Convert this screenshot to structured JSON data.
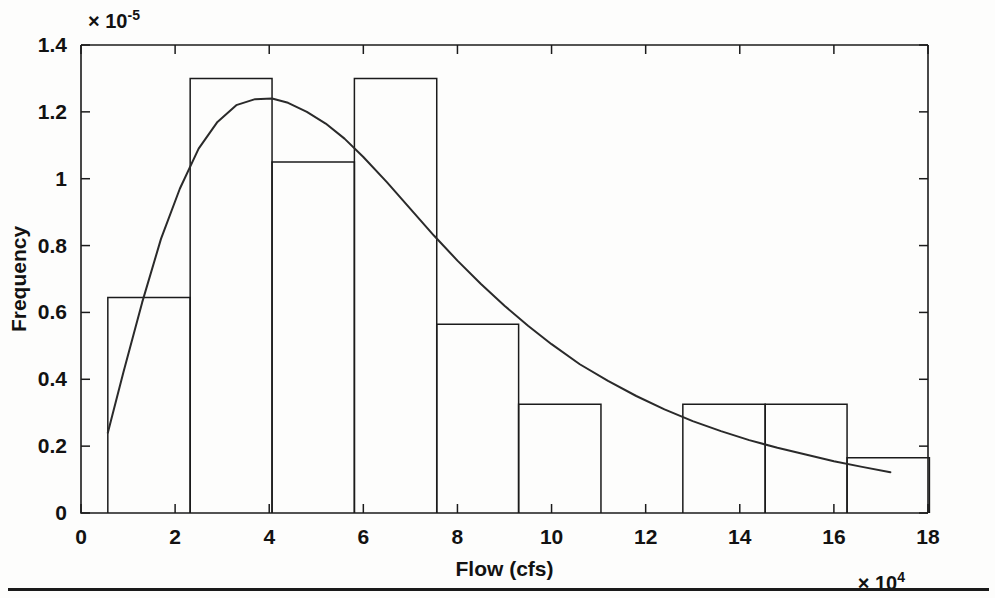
{
  "figure": {
    "background_color": "#fdfdfc",
    "ink_color": "#1b1b1b",
    "footer_rule": true
  },
  "chart_data": {
    "type": "bar",
    "title": "",
    "subtitle": "",
    "xlabel": "Flow (cfs)",
    "ylabel": "Frequency",
    "x_exponent_label": "× 10",
    "x_exponent_power": "4",
    "y_exponent_label": "× 10",
    "y_exponent_power": "-5",
    "x_multiplier": 10000,
    "y_multiplier": 1e-05,
    "xlim": [
      0,
      18
    ],
    "ylim": [
      0,
      1.4
    ],
    "xticks": [
      0,
      2,
      4,
      6,
      8,
      10,
      12,
      14,
      16,
      18
    ],
    "xticklabels": [
      "0",
      "2",
      "4",
      "6",
      "8",
      "10",
      "12",
      "14",
      "16",
      "18"
    ],
    "yticks": [
      0,
      0.2,
      0.4,
      0.6,
      0.8,
      1,
      1.2,
      1.4
    ],
    "yticklabels": [
      "0",
      "0.2",
      "0.4",
      "0.6",
      "0.8",
      "1",
      "1.2",
      "1.4"
    ],
    "grid": false,
    "legend": false,
    "legend_position": "none",
    "bin_edges": [
      0.57,
      2.32,
      4.06,
      5.81,
      7.56,
      9.3,
      11.05,
      12.79,
      14.54,
      16.28,
      18.03
    ],
    "bar_edges": [
      [
        0.57,
        2.32
      ],
      [
        2.32,
        4.06
      ],
      [
        4.06,
        5.81
      ],
      [
        5.81,
        7.56
      ],
      [
        7.56,
        9.3
      ],
      [
        9.3,
        11.05
      ],
      [
        12.79,
        14.54
      ],
      [
        14.54,
        16.28
      ],
      [
        16.28,
        18.03
      ]
    ],
    "values": [
      0.645,
      1.3,
      1.05,
      1.3,
      0.565,
      0.325,
      0.325,
      0.325,
      0.165
    ],
    "series": [
      {
        "name": "histogram",
        "values": [
          0.645,
          1.3,
          1.05,
          1.3,
          0.565,
          0.325,
          0.325,
          0.325,
          0.165
        ]
      },
      {
        "name": "fitted density curve",
        "x": [
          0.57,
          0.9,
          1.3,
          1.7,
          2.1,
          2.5,
          2.9,
          3.3,
          3.7,
          4.06,
          4.4,
          4.8,
          5.2,
          5.6,
          6.0,
          6.5,
          7.0,
          7.5,
          8.0,
          8.5,
          9.0,
          9.5,
          10.0,
          10.6,
          11.2,
          11.8,
          12.4,
          13.0,
          13.6,
          14.2,
          14.8,
          15.4,
          16.0,
          16.6,
          17.2
        ],
        "y": [
          0.24,
          0.42,
          0.63,
          0.82,
          0.97,
          1.09,
          1.17,
          1.22,
          1.238,
          1.24,
          1.227,
          1.2,
          1.165,
          1.12,
          1.065,
          0.99,
          0.91,
          0.83,
          0.755,
          0.685,
          0.62,
          0.56,
          0.505,
          0.445,
          0.395,
          0.35,
          0.31,
          0.275,
          0.245,
          0.218,
          0.195,
          0.175,
          0.155,
          0.138,
          0.122
        ]
      }
    ],
    "note": "Histogram of streamflow with fitted probability density; y in units of 1e-5, x in units of 1e4 cfs"
  }
}
